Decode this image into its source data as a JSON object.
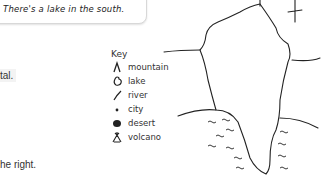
{
  "speech_bubble": {
    "text": "There's a lake in the south."
  },
  "text_fragments": {
    "top": "tal.",
    "bottom": "he right."
  },
  "key": {
    "title": "Key",
    "items": [
      {
        "icon": "mountain-icon",
        "label": "mountain"
      },
      {
        "icon": "lake-icon",
        "label": "lake"
      },
      {
        "icon": "river-icon",
        "label": "river"
      },
      {
        "icon": "city-icon",
        "label": "city"
      },
      {
        "icon": "desert-icon",
        "label": "desert"
      },
      {
        "icon": "volcano-icon",
        "label": "volcano"
      }
    ]
  },
  "colors": {
    "ink": "#222222",
    "fragment_bg": "#f3f3f3"
  }
}
